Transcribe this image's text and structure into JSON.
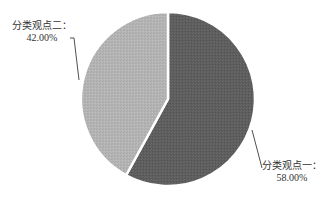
{
  "chart_data": {
    "type": "pie",
    "title": "",
    "categories": [
      "分类观点一",
      "分类观点二"
    ],
    "values": [
      58.0,
      42.0
    ],
    "labels": [
      "分类观点一：58.00%",
      "分类观点二：42.00%"
    ],
    "colors": [
      "#5e5e5e",
      "#b4b4b4"
    ],
    "start_angle_deg": 0,
    "direction": "clockwise",
    "legend": false
  },
  "labels": {
    "slice1_name": "分类观点一：",
    "slice1_value": "58.00%",
    "slice2_name": "分类观点二：",
    "slice2_value": "42.00%"
  }
}
